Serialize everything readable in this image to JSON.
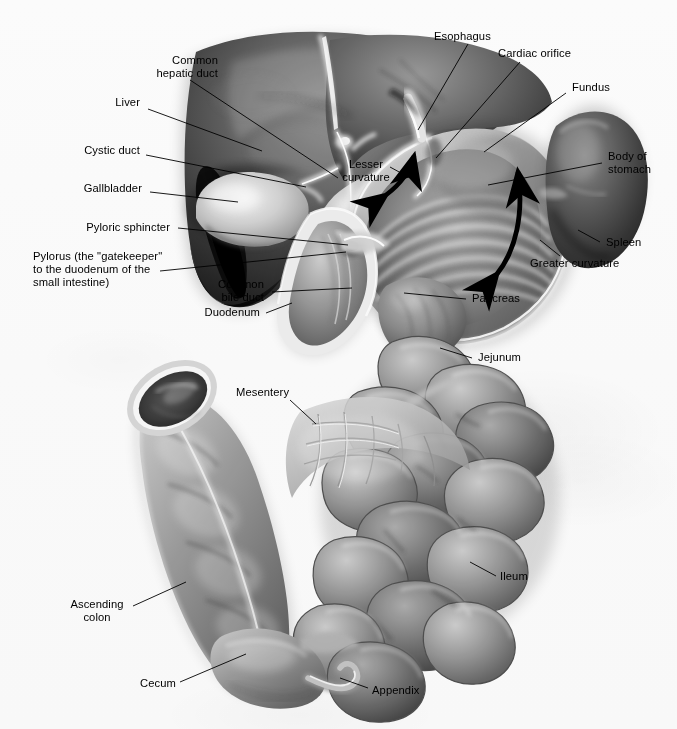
{
  "figure": {
    "media": "grayscale anatomical airbrush illustration",
    "background_color": "#ffffff",
    "label_color": "#000000",
    "leader_color": "#000000"
  },
  "labels": [
    {
      "id": "common-hepatic-duct",
      "text": "Common\nhepatic duct"
    },
    {
      "id": "liver",
      "text": "Liver"
    },
    {
      "id": "cystic-duct",
      "text": "Cystic duct"
    },
    {
      "id": "gallbladder",
      "text": "Gallbladder"
    },
    {
      "id": "pyloric-sphincter",
      "text": "Pyloric sphincter"
    },
    {
      "id": "pylorus",
      "text": "Pylorus (the \"gatekeeper\"\nto the duodenum of the\nsmall intestine)"
    },
    {
      "id": "common-bile-duct",
      "text": "Common\nbile duct"
    },
    {
      "id": "duodenum",
      "text": "Duodenum"
    },
    {
      "id": "lesser-curvature",
      "text": "Lesser\ncurvature"
    },
    {
      "id": "esophagus",
      "text": "Esophagus"
    },
    {
      "id": "cardiac-orifice",
      "text": "Cardiac orifice"
    },
    {
      "id": "fundus",
      "text": "Fundus"
    },
    {
      "id": "body-of-stomach",
      "text": "Body of\nstomach"
    },
    {
      "id": "spleen",
      "text": "Spleen"
    },
    {
      "id": "greater-curvature",
      "text": "Greater curvature"
    },
    {
      "id": "pancreas",
      "text": "Pancreas"
    },
    {
      "id": "jejunum",
      "text": "Jejunum"
    },
    {
      "id": "mesentery",
      "text": "Mesentery"
    },
    {
      "id": "ileum",
      "text": "Ileum"
    },
    {
      "id": "ascending-colon",
      "text": "Ascending\ncolon"
    },
    {
      "id": "cecum",
      "text": "Cecum"
    },
    {
      "id": "appendix",
      "text": "Appendix"
    }
  ],
  "arrows": [
    {
      "id": "lesser-curvature-arrow",
      "style": "double-headed curved arrow",
      "meaning": "extent of the lesser curvature"
    },
    {
      "id": "greater-curvature-arrow",
      "style": "double-headed curved arrow",
      "meaning": "extent of the greater curvature"
    }
  ]
}
